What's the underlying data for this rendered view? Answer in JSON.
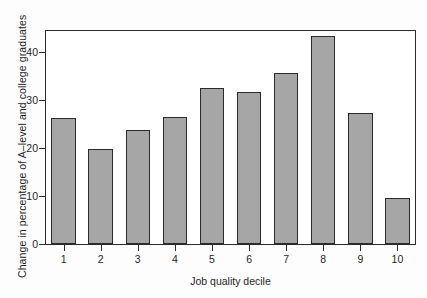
{
  "chart_data": {
    "type": "bar",
    "title": "",
    "subtitle": "",
    "xlabel": "Job quality decile",
    "ylabel": "Change in percentage of A–level and college graduates",
    "categories": [
      "1",
      "2",
      "3",
      "4",
      "5",
      "6",
      "7",
      "8",
      "9",
      "10"
    ],
    "values": [
      26.2,
      19.7,
      23.8,
      26.4,
      32.4,
      31.6,
      35.5,
      43.2,
      27.2,
      9.5
    ],
    "ylim": [
      0,
      44.5
    ],
    "xlim": [
      0.4,
      10.6
    ],
    "yticks": [
      0,
      10,
      20,
      30,
      40
    ],
    "ytick_labels": [
      "0",
      "10",
      "20",
      "30",
      "40"
    ],
    "xtick_labels": [
      "1",
      "2",
      "3",
      "4",
      "5",
      "6",
      "7",
      "8",
      "9",
      "10"
    ],
    "grid": false,
    "legend": null,
    "legend_position": "none",
    "annotations": [],
    "colors": {
      "bar_fill": "#a6a6a6",
      "bar_edge": "#2b2b2b",
      "axis": "#2b2b2b",
      "text": "#1f1f1f",
      "plot_background": "#ffffff",
      "figure_background": "#fdfdfd"
    }
  }
}
